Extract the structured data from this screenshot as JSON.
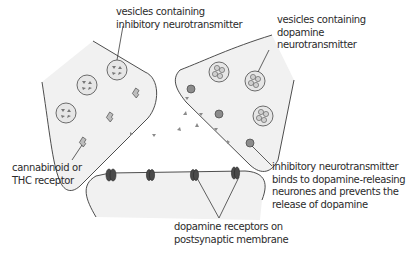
{
  "labels": {
    "inhibitory_vesicles": [
      "vesicles containing",
      "inhibitory neurotransmitter"
    ],
    "dopamine_vesicles": [
      "vesicles containing",
      "dopamine",
      "neurotransmitter"
    ],
    "cannabinoid_receptor": [
      "cannabinoid or",
      "THC receptor"
    ],
    "inhibitory_binding": [
      "inhibitory neurotransmitter",
      "binds to dopamine-releasing",
      "neurones and prevents the",
      "release of dopamine"
    ],
    "dopamine_receptors": [
      "dopamine receptors on",
      "postsynaptic membrane"
    ]
  },
  "colors": {
    "cell_fill": "#f1f1f1",
    "outline": "#3a3a3a",
    "vesicle_fill": "#e6e6e6",
    "molecule": "#8a8a8a",
    "receptor_dark": "#4a4a4a",
    "text": "#2b2b2b"
  }
}
